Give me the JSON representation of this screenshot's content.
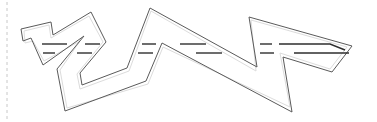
{
  "diagram": {
    "width": 377,
    "height": 122,
    "background": "#ffffff",
    "colors": {
      "outline": "#5a5a5a",
      "inner_offset": "#dcdcdc",
      "dashes": "#2e2e2e",
      "guide": "#c8c8c8"
    },
    "guide_line": {
      "x": 7,
      "y1": 2,
      "y2": 120
    },
    "outline_points": [
      [
        21,
        29
      ],
      [
        51,
        22
      ],
      [
        53,
        35
      ],
      [
        91,
        12
      ],
      [
        106,
        42
      ],
      [
        80,
        73
      ],
      [
        82,
        85
      ],
      [
        127,
        68
      ],
      [
        150,
        8
      ],
      [
        257,
        67
      ],
      [
        249,
        17
      ],
      [
        352,
        46
      ],
      [
        332,
        72
      ],
      [
        283,
        57
      ],
      [
        292,
        112
      ],
      [
        162,
        43
      ],
      [
        146,
        81
      ],
      [
        65,
        111
      ],
      [
        57,
        69
      ],
      [
        84,
        36
      ],
      [
        43,
        65
      ],
      [
        31,
        38
      ],
      [
        23,
        41
      ]
    ],
    "inner_offset_points": [
      [
        24,
        31
      ],
      [
        49,
        25
      ],
      [
        51,
        38
      ],
      [
        89,
        16
      ],
      [
        103,
        42
      ],
      [
        77,
        74
      ],
      [
        80,
        89
      ],
      [
        129,
        71
      ],
      [
        151,
        11
      ],
      [
        256,
        71
      ],
      [
        251,
        20
      ],
      [
        347,
        47
      ],
      [
        330,
        69
      ],
      [
        280,
        53
      ],
      [
        290,
        107
      ],
      [
        163,
        47
      ],
      [
        148,
        84
      ],
      [
        67,
        108
      ],
      [
        60,
        70
      ],
      [
        80,
        41
      ],
      [
        44,
        61
      ],
      [
        33,
        41
      ],
      [
        25,
        43
      ]
    ],
    "dash_rows": [
      {
        "name": "upper-lane",
        "segments": [
          [
            [
              42,
              44
            ],
            [
              67,
              44
            ]
          ],
          [
            [
              85,
              44
            ],
            [
              100,
              44
            ]
          ],
          [
            [
              142,
              44
            ],
            [
              156,
              44
            ]
          ],
          [
            [
              180,
              44
            ],
            [
              206,
              44
            ]
          ],
          [
            [
              260,
              44
            ],
            [
              272,
              44
            ]
          ],
          [
            [
              279,
              44
            ],
            [
              330,
              44
            ],
            [
              345,
              50
            ]
          ]
        ]
      },
      {
        "name": "lower-lane",
        "segments": [
          [
            [
              43,
              53
            ],
            [
              55,
              53
            ]
          ],
          [
            [
              77,
              53
            ],
            [
              92,
              53
            ]
          ],
          [
            [
              138,
              53
            ],
            [
              153,
              53
            ]
          ],
          [
            [
              196,
              53
            ],
            [
              222,
              53
            ]
          ],
          [
            [
              260,
              53
            ],
            [
              274,
              53
            ]
          ],
          [
            [
              294,
              53
            ],
            [
              349,
              53
            ]
          ]
        ]
      }
    ]
  }
}
